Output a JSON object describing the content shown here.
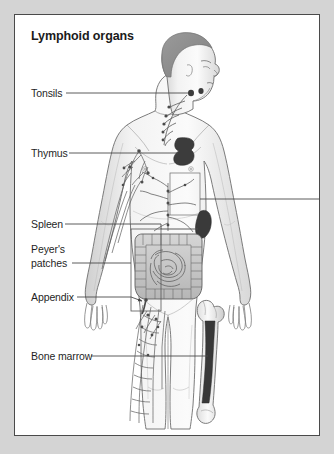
{
  "figure": {
    "title": "Lymphoid organs",
    "background_color": "#d4d4d4",
    "panel_color": "#ffffff",
    "panel_border_color": "#4a4a4a",
    "label_color": "#1f1f1f",
    "organ_fill_dark": "#3a3a3a",
    "line_color": "#555555",
    "skin_outline_color": "#6b6b6b",
    "hair_color": "#8e8e8e"
  },
  "labels": [
    {
      "id": "tonsils",
      "text": "Tonsils",
      "line_2": ""
    },
    {
      "id": "thymus",
      "text": "Thymus",
      "line_2": ""
    },
    {
      "id": "spleen",
      "text": "Spleen",
      "line_2": ""
    },
    {
      "id": "peyers-patches",
      "text": "Peyer's",
      "line_2": "patches"
    },
    {
      "id": "appendix",
      "text": "Appendix",
      "line_2": ""
    },
    {
      "id": "bone-marrow",
      "text": "Bone marrow",
      "line_2": ""
    }
  ],
  "illustration": {
    "subject": "human-figure-anterior-with-head-in-profile",
    "structures": [
      "hair",
      "face-profile",
      "tonsil-nodes",
      "cervical-lymph-node-chain",
      "thymus",
      "axillary-lymph-vessels",
      "thoracic-duct-branches",
      "spleen",
      "large-intestine",
      "small-intestine",
      "appendix",
      "inguinal-lymph-vessels",
      "femur",
      "bone-marrow-cavity",
      "peyers-patches-bracket"
    ]
  }
}
